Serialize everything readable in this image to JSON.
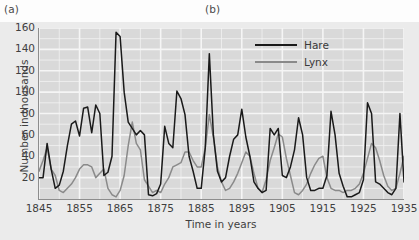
{
  "panels": {
    "a": "(a)",
    "b": "(b)"
  },
  "chart_data": {
    "type": "line",
    "title": "",
    "xlabel": "Time in years",
    "ylabel": "Number in thousands",
    "xlim": [
      1845,
      1935
    ],
    "ylim": [
      0,
      160
    ],
    "xticks": [
      1845,
      1855,
      1865,
      1875,
      1885,
      1895,
      1905,
      1915,
      1925,
      1935
    ],
    "yticks": [
      20,
      40,
      60,
      80,
      100,
      120,
      140,
      160
    ],
    "grid": true,
    "grid_minor_step": 10,
    "legend_position": "top-right",
    "colors": {
      "hare": "#1a1a1a",
      "lynx": "#8a8a8a",
      "plot_background": "#d9d9d9",
      "figure_background": "#ebebeb",
      "gridline": "#f5f5f5"
    },
    "x": [
      1845,
      1846,
      1847,
      1848,
      1849,
      1850,
      1851,
      1852,
      1853,
      1854,
      1855,
      1856,
      1857,
      1858,
      1859,
      1860,
      1861,
      1862,
      1863,
      1864,
      1865,
      1866,
      1867,
      1868,
      1869,
      1870,
      1871,
      1872,
      1873,
      1874,
      1875,
      1876,
      1877,
      1878,
      1879,
      1880,
      1881,
      1882,
      1883,
      1884,
      1885,
      1886,
      1887,
      1888,
      1889,
      1890,
      1891,
      1892,
      1893,
      1894,
      1895,
      1896,
      1897,
      1898,
      1899,
      1900,
      1901,
      1902,
      1903,
      1904,
      1905,
      1906,
      1907,
      1908,
      1909,
      1910,
      1911,
      1912,
      1913,
      1914,
      1915,
      1916,
      1917,
      1918,
      1919,
      1920,
      1921,
      1922,
      1923,
      1924,
      1925,
      1926,
      1927,
      1928,
      1929,
      1930,
      1931,
      1932,
      1933,
      1934,
      1935
    ],
    "series": [
      {
        "name": "Hare",
        "color": "#1a1a1a",
        "values": [
          20,
          20,
          52,
          28,
          10,
          13,
          26,
          50,
          70,
          73,
          59,
          85,
          86,
          62,
          88,
          80,
          22,
          25,
          40,
          156,
          152,
          100,
          72,
          66,
          60,
          64,
          60,
          4,
          3,
          5,
          14,
          68,
          52,
          48,
          101,
          94,
          79,
          40,
          26,
          10,
          10,
          48,
          136,
          60,
          26,
          16,
          20,
          40,
          56,
          60,
          84,
          58,
          40,
          16,
          10,
          6,
          8,
          66,
          60,
          66,
          22,
          20,
          30,
          46,
          76,
          60,
          20,
          8,
          8,
          10,
          10,
          22,
          82,
          60,
          24,
          12,
          2,
          2,
          4,
          6,
          18,
          90,
          80,
          16,
          14,
          10,
          6,
          4,
          10,
          80,
          16
        ]
      },
      {
        "name": "Lynx",
        "color": "#8a8a8a",
        "values": [
          26,
          36,
          48,
          28,
          22,
          8,
          6,
          10,
          14,
          20,
          28,
          32,
          32,
          30,
          20,
          24,
          28,
          10,
          4,
          2,
          8,
          22,
          50,
          72,
          52,
          46,
          18,
          12,
          6,
          8,
          6,
          14,
          20,
          30,
          32,
          34,
          44,
          44,
          36,
          30,
          30,
          48,
          79,
          58,
          30,
          16,
          8,
          10,
          16,
          24,
          34,
          44,
          40,
          24,
          10,
          6,
          18,
          36,
          48,
          61,
          58,
          38,
          22,
          6,
          4,
          8,
          14,
          24,
          32,
          38,
          40,
          20,
          10,
          8,
          8,
          6,
          8,
          8,
          10,
          14,
          24,
          38,
          52,
          48,
          36,
          22,
          12,
          8,
          10,
          24,
          40
        ]
      }
    ]
  },
  "legend": [
    {
      "label": "Hare",
      "color": "#1a1a1a"
    },
    {
      "label": "Lynx",
      "color": "#8a8a8a"
    }
  ]
}
